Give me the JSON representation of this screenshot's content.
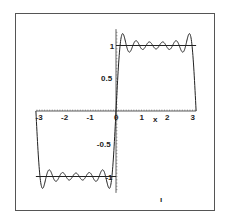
{
  "chart_data": {
    "type": "line",
    "title": "",
    "xlabel": "x",
    "ylabel": "",
    "xlim": [
      -3.1416,
      3.1416
    ],
    "ylim": [
      -1.2,
      1.2
    ],
    "grid": false,
    "legend": null,
    "x_ticks": [
      -3,
      -2,
      -1,
      0,
      1,
      2,
      3
    ],
    "x_tick_labels": [
      "-3",
      "-2",
      "-1",
      "0",
      "1",
      "x",
      "2",
      "3"
    ],
    "y_ticks": [
      1,
      0.5,
      -0.5,
      -1
    ],
    "y_tick_labels": [
      "1",
      "0.5",
      "-0.5",
      "-1"
    ],
    "series": [
      {
        "name": "square wave sign(x)",
        "kind": "piecewise",
        "segments": [
          {
            "x": [
              -3.1416,
              0
            ],
            "y": [
              -1,
              -1
            ]
          },
          {
            "x": [
              0,
              3.1416
            ],
            "y": [
              1,
              1
            ]
          }
        ],
        "color": "#222222"
      },
      {
        "name": "Fourier partial sum (6 odd harmonics)",
        "kind": "fourier_square",
        "harmonics": 6,
        "color": "#222222",
        "approx_points": [
          {
            "x": -3.1416,
            "y": 0
          },
          {
            "x": -2.9,
            "y": -1.18
          },
          {
            "x": -1.57,
            "y": -1.08
          },
          {
            "x": -0.25,
            "y": -1.18
          },
          {
            "x": 0,
            "y": 0
          },
          {
            "x": 0.25,
            "y": 1.18
          },
          {
            "x": 1.57,
            "y": 1.08
          },
          {
            "x": 2.9,
            "y": 1.18
          },
          {
            "x": 3.1416,
            "y": 0
          }
        ]
      }
    ]
  },
  "annotations": {
    "stray_mark": "ı"
  }
}
